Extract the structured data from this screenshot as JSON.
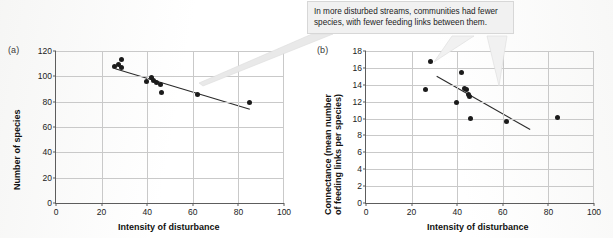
{
  "figure": {
    "callout_text": "In more disturbed streams, communities had fewer species, with fewer feeding links between them."
  },
  "chart_data": [
    {
      "type": "scatter",
      "panel_label": "(a)",
      "title": "",
      "xlabel": "Intensity of disturbance",
      "ylabel": "Number of species",
      "xlim": [
        0,
        100
      ],
      "ylim": [
        0,
        120
      ],
      "xticks": [
        0,
        20,
        40,
        60,
        80,
        100
      ],
      "yticks": [
        0,
        20,
        40,
        60,
        80,
        100,
        120
      ],
      "grid": true,
      "legend": "none",
      "points": [
        {
          "x": 25.8,
          "y": 108.0
        },
        {
          "x": 27.2,
          "y": 109.0
        },
        {
          "x": 28.6,
          "y": 113.0
        },
        {
          "x": 28.8,
          "y": 107.0
        },
        {
          "x": 39.6,
          "y": 96.0
        },
        {
          "x": 42.0,
          "y": 99.0
        },
        {
          "x": 42.6,
          "y": 96.5
        },
        {
          "x": 44.0,
          "y": 95.0
        },
        {
          "x": 45.8,
          "y": 93.5
        },
        {
          "x": 46.2,
          "y": 87.0
        },
        {
          "x": 62.0,
          "y": 86.0
        },
        {
          "x": 84.8,
          "y": 79.0
        }
      ],
      "trendline": {
        "x0": 26.0,
        "y0": 106.0,
        "x1": 85.0,
        "y1": 74.0
      }
    },
    {
      "type": "scatter",
      "panel_label": "(b)",
      "title": "",
      "xlabel": "Intensity of disturbance",
      "ylabel": "Connectance (mean number of feeding links per species)",
      "xlim": [
        0,
        100
      ],
      "ylim": [
        0,
        18
      ],
      "xticks": [
        0,
        20,
        40,
        60,
        80,
        100
      ],
      "yticks": [
        0,
        2,
        4,
        6,
        8,
        10,
        12,
        14,
        16,
        18
      ],
      "grid": true,
      "legend": "none",
      "points": [
        {
          "x": 26.2,
          "y": 13.5
        },
        {
          "x": 28.4,
          "y": 16.8
        },
        {
          "x": 39.6,
          "y": 11.9
        },
        {
          "x": 42.0,
          "y": 15.5
        },
        {
          "x": 43.4,
          "y": 13.6
        },
        {
          "x": 44.2,
          "y": 13.5
        },
        {
          "x": 44.8,
          "y": 12.9
        },
        {
          "x": 45.6,
          "y": 12.6
        },
        {
          "x": 46.0,
          "y": 10.0
        },
        {
          "x": 61.6,
          "y": 9.6
        },
        {
          "x": 84.2,
          "y": 10.1
        }
      ],
      "trendline": {
        "x0": 31.0,
        "y0": 15.0,
        "x1": 72.0,
        "y1": 8.7
      }
    }
  ]
}
